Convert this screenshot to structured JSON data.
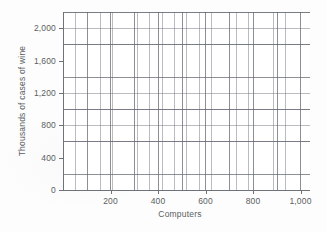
{
  "chart_data": {
    "type": "scatter",
    "title": "",
    "subtitle": "",
    "xlabel": "Computers",
    "ylabel": "Thousands of cases of wine",
    "xlim": [
      0,
      1040
    ],
    "ylim": [
      0,
      2200
    ],
    "xticks": [
      200,
      400,
      600,
      800,
      1000
    ],
    "xticklabels": [
      "200",
      "400",
      "600",
      "800",
      "1,000"
    ],
    "yticks": [
      0,
      400,
      800,
      1200,
      1600,
      2000
    ],
    "yticklabels": [
      "0",
      "400",
      "800",
      "1,200",
      "1,600",
      "2,000"
    ],
    "x_minor_step": 50,
    "y_minor_step": 200,
    "x_major_step": 100,
    "y_major_step": 400,
    "grid": true,
    "legend": null,
    "series": [],
    "annotations": [],
    "note": "Empty coordinate grid with no plotted data points or curves.",
    "colors": {
      "background": "#ffffff",
      "grid_minor": "#787e86",
      "grid_major": "#5f656e",
      "axis": "#6e737a",
      "text": "#5a5d62"
    }
  }
}
